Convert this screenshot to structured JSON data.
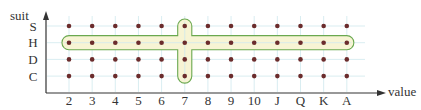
{
  "diagram": {
    "axes": {
      "y_label": "suit",
      "x_label": "value"
    },
    "suits": [
      "S",
      "H",
      "D",
      "C"
    ],
    "values": [
      "2",
      "3",
      "4",
      "5",
      "6",
      "7",
      "8",
      "9",
      "10",
      "J",
      "Q",
      "K",
      "A"
    ],
    "highlights": [
      {
        "name": "row-H",
        "kind": "row",
        "suit": "H",
        "from": "2",
        "to": "A"
      },
      {
        "name": "column-7",
        "kind": "column",
        "value": "7",
        "from": "S",
        "to": "C"
      }
    ],
    "colors": {
      "grid": "#cfe8ee",
      "axis": "#333333",
      "dot": "#6b2c2c",
      "highlight_fill": "#f7f4d4",
      "highlight_stroke": "#6aa84f"
    }
  }
}
